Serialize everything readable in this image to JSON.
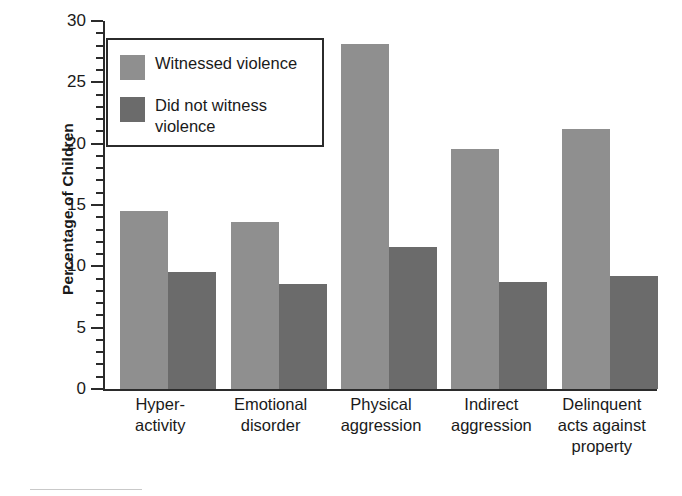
{
  "chart_data": {
    "type": "bar",
    "title": "",
    "xlabel": "",
    "ylabel": "Percentage of Children",
    "ylim": [
      0,
      30
    ],
    "ytick_step": 5,
    "yminor_step": 1,
    "grid": false,
    "legend_position": "upper-left-inside",
    "categories": [
      "Hyper-\nactivity",
      "Emotional\ndisorder",
      "Physical\naggression",
      "Indirect\naggression",
      "Delinquent\nacts against\nproperty"
    ],
    "ytick_labels": [
      "0",
      "5",
      "10",
      "15",
      "20",
      "25",
      "30"
    ],
    "ytick_values": [
      0,
      5,
      10,
      15,
      20,
      25,
      30
    ],
    "series": [
      {
        "name": "Witnessed violence",
        "color": "#8f8f8f",
        "values": [
          14.5,
          13.6,
          28.1,
          19.6,
          21.2
        ]
      },
      {
        "name": "Did not witness violence",
        "color": "#6b6b6b",
        "values": [
          9.5,
          8.6,
          11.6,
          8.7,
          9.2
        ]
      }
    ]
  },
  "legend": {
    "entries": [
      {
        "label": "Witnessed violence",
        "color": "#8f8f8f"
      },
      {
        "label": "Did not witness\nviolence",
        "color": "#6b6b6b"
      }
    ]
  },
  "axis": {
    "y_title": "Percentage of Children"
  }
}
